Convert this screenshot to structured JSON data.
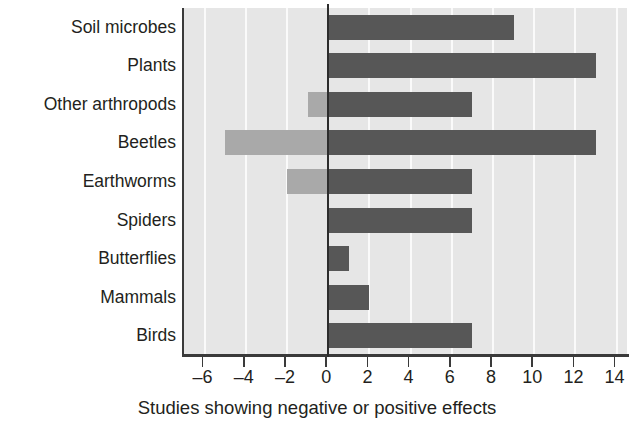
{
  "chart_data": {
    "type": "bar",
    "orientation": "horizontal",
    "title": "",
    "xlabel": "Studies showing negative or positive effects",
    "ylabel": "",
    "xlim": [
      -7,
      14.6
    ],
    "xticks": [
      -6,
      -4,
      -2,
      0,
      2,
      4,
      6,
      8,
      10,
      12,
      14
    ],
    "xticklabels": [
      "–6",
      "–4",
      "–2",
      "0",
      "2",
      "4",
      "6",
      "8",
      "10",
      "12",
      "14"
    ],
    "grid": "vertical white gridlines at each tick, light gray plot background",
    "legend": "none",
    "zero_reference_line": true,
    "categories": [
      "Soil microbes",
      "Plants",
      "Other arthropods",
      "Beetles",
      "Earthworms",
      "Spiders",
      "Butterflies",
      "Mammals",
      "Birds"
    ],
    "counts": [
      "(8)",
      "(2)",
      "(2)",
      "(3)",
      "(4)",
      "(3)",
      "(1)",
      "(0)",
      "(2)"
    ],
    "series": [
      {
        "name": "Positive effects",
        "color": "#575757",
        "values": [
          9,
          13,
          7,
          13,
          7,
          7,
          1,
          2,
          7
        ]
      },
      {
        "name": "Negative effects",
        "color": "#a9a9a9",
        "values": [
          0,
          0,
          -1,
          -5,
          -2,
          0,
          0,
          0,
          0
        ]
      }
    ],
    "rows": [
      {
        "category": "Soil microbes",
        "count": "(8)",
        "positive": 9,
        "negative": 0
      },
      {
        "category": "Plants",
        "count": "(2)",
        "positive": 13,
        "negative": 0
      },
      {
        "category": "Other arthropods",
        "count": "(2)",
        "positive": 7,
        "negative": -1
      },
      {
        "category": "Beetles",
        "count": "(3)",
        "positive": 13,
        "negative": -5
      },
      {
        "category": "Earthworms",
        "count": "(4)",
        "positive": 7,
        "negative": -2
      },
      {
        "category": "Spiders",
        "count": "(3)",
        "positive": 7,
        "negative": 0
      },
      {
        "category": "Butterflies",
        "count": "(1)",
        "positive": 1,
        "negative": 0
      },
      {
        "category": "Mammals",
        "count": "(0)",
        "positive": 2,
        "negative": 0
      },
      {
        "category": "Birds",
        "count": "(2)",
        "positive": 7,
        "negative": 0
      }
    ],
    "colors": {
      "positive_bar": "#575757",
      "negative_bar": "#a9a9a9",
      "plot_background": "#e6e6e6",
      "gridline": "#fafafa",
      "axis": "#3a3a3a",
      "text": "#231f20"
    }
  }
}
